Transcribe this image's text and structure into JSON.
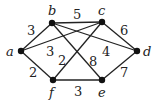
{
  "graph": {
    "nodes": [
      {
        "id": "a",
        "label": "a",
        "x": 21,
        "y": 51,
        "lx": 6,
        "ly": 56
      },
      {
        "id": "b",
        "label": "b",
        "x": 52,
        "y": 23,
        "lx": 48,
        "ly": 15
      },
      {
        "id": "c",
        "label": "c",
        "x": 102,
        "y": 22,
        "lx": 98,
        "ly": 15
      },
      {
        "id": "d",
        "label": "d",
        "x": 137,
        "y": 51,
        "lx": 143,
        "ly": 56
      },
      {
        "id": "e",
        "label": "e",
        "x": 102,
        "y": 80,
        "lx": 98,
        "ly": 97
      },
      {
        "id": "f",
        "label": "f",
        "x": 53,
        "y": 80,
        "lx": 49,
        "ly": 97
      }
    ],
    "edges": [
      {
        "from": "a",
        "to": "b",
        "weight": "3",
        "lx": 27,
        "ly": 35
      },
      {
        "from": "b",
        "to": "c",
        "weight": "5",
        "lx": 73,
        "ly": 19
      },
      {
        "from": "c",
        "to": "d",
        "weight": "6",
        "lx": 120,
        "ly": 35
      },
      {
        "from": "d",
        "to": "e",
        "weight": "7",
        "lx": 120,
        "ly": 77
      },
      {
        "from": "e",
        "to": "f",
        "weight": "3",
        "lx": 74,
        "ly": 96
      },
      {
        "from": "f",
        "to": "a",
        "weight": "2",
        "lx": 29,
        "ly": 77
      },
      {
        "from": "a",
        "to": "c",
        "weight": "3",
        "lx": 46,
        "ly": 56
      },
      {
        "from": "b",
        "to": "d",
        "weight": "4",
        "lx": 102,
        "ly": 56
      },
      {
        "from": "b",
        "to": "e",
        "weight": "8",
        "lx": 89,
        "ly": 66
      },
      {
        "from": "c",
        "to": "f",
        "weight": "2",
        "lx": 58,
        "ly": 65
      }
    ]
  }
}
